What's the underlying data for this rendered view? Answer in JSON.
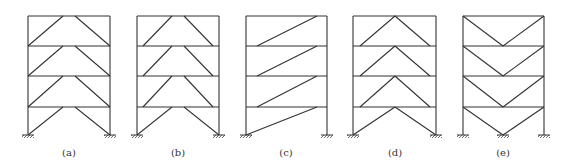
{
  "diagram": {
    "stroke_color": "#333333",
    "frames": [
      {
        "id": "a",
        "label": "(a)",
        "type": "inverted-V (chevron) bracing to column-beam joints"
      },
      {
        "id": "b",
        "label": "(b)",
        "type": "inverted-V bracing with eccentric ends"
      },
      {
        "id": "c",
        "label": "(c)",
        "type": "single diagonal bracing"
      },
      {
        "id": "d",
        "label": "(d)",
        "type": "inverted-V bracing with apex at beam midspan"
      },
      {
        "id": "e",
        "label": "(e)",
        "type": "V bracing"
      }
    ]
  }
}
